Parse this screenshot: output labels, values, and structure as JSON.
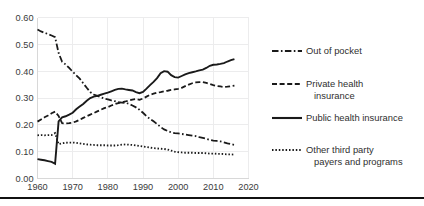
{
  "chart_data": {
    "type": "line",
    "title": "",
    "subtitle": "",
    "xlabel": "",
    "ylabel": "",
    "xlim": [
      1960,
      2020
    ],
    "ylim": [
      0.0,
      0.6
    ],
    "grid": true,
    "legend_position": "right",
    "x_ticks": [
      "1960",
      "1970",
      "1980",
      "1990",
      "2000",
      "2010",
      "2020"
    ],
    "x_tick_values": [
      1960,
      1970,
      1980,
      1990,
      2000,
      2010,
      2020
    ],
    "y_ticks": [
      "0.00",
      "0.10",
      "0.20",
      "0.30",
      "0.40",
      "0.50",
      "0.60"
    ],
    "y_tick_values": [
      0.0,
      0.1,
      0.2,
      0.3,
      0.4,
      0.5,
      0.6
    ],
    "series": [
      {
        "name": "Out of pocket",
        "style": "dashdot",
        "x": [
          1960,
          1961,
          1962,
          1963,
          1964,
          1965,
          1966,
          1967,
          1968,
          1969,
          1970,
          1971,
          1972,
          1973,
          1974,
          1975,
          1976,
          1977,
          1978,
          1979,
          1980,
          1981,
          1982,
          1983,
          1984,
          1985,
          1986,
          1987,
          1988,
          1989,
          1990,
          1991,
          1992,
          1993,
          1994,
          1995,
          1996,
          1997,
          1998,
          1999,
          2000,
          2001,
          2002,
          2003,
          2004,
          2005,
          2006,
          2007,
          2008,
          2009,
          2010,
          2011,
          2012,
          2013,
          2014,
          2015,
          2016
        ],
        "values": [
          0.555,
          0.548,
          0.543,
          0.538,
          0.533,
          0.527,
          0.468,
          0.435,
          0.425,
          0.412,
          0.398,
          0.385,
          0.372,
          0.355,
          0.338,
          0.322,
          0.313,
          0.308,
          0.303,
          0.298,
          0.295,
          0.291,
          0.288,
          0.285,
          0.283,
          0.282,
          0.278,
          0.272,
          0.265,
          0.256,
          0.245,
          0.232,
          0.222,
          0.213,
          0.203,
          0.192,
          0.183,
          0.177,
          0.172,
          0.169,
          0.168,
          0.166,
          0.164,
          0.162,
          0.16,
          0.158,
          0.154,
          0.151,
          0.148,
          0.144,
          0.141,
          0.14,
          0.138,
          0.135,
          0.131,
          0.128,
          0.125
        ]
      },
      {
        "name": "Private health insurance",
        "style": "dashed",
        "x": [
          1960,
          1961,
          1962,
          1963,
          1964,
          1965,
          1966,
          1967,
          1968,
          1969,
          1970,
          1971,
          1972,
          1973,
          1974,
          1975,
          1976,
          1977,
          1978,
          1979,
          1980,
          1981,
          1982,
          1983,
          1984,
          1985,
          1986,
          1987,
          1988,
          1989,
          1990,
          1991,
          1992,
          1993,
          1994,
          1995,
          1996,
          1997,
          1998,
          1999,
          2000,
          2001,
          2002,
          2003,
          2004,
          2005,
          2006,
          2007,
          2008,
          2009,
          2010,
          2011,
          2012,
          2013,
          2014,
          2015,
          2016
        ],
        "values": [
          0.212,
          0.22,
          0.228,
          0.235,
          0.243,
          0.249,
          0.233,
          0.206,
          0.205,
          0.206,
          0.208,
          0.213,
          0.219,
          0.226,
          0.232,
          0.238,
          0.244,
          0.25,
          0.256,
          0.262,
          0.266,
          0.272,
          0.277,
          0.281,
          0.284,
          0.287,
          0.291,
          0.294,
          0.296,
          0.293,
          0.298,
          0.305,
          0.312,
          0.316,
          0.32,
          0.322,
          0.325,
          0.327,
          0.33,
          0.332,
          0.334,
          0.338,
          0.344,
          0.35,
          0.355,
          0.358,
          0.359,
          0.359,
          0.356,
          0.352,
          0.348,
          0.345,
          0.343,
          0.341,
          0.342,
          0.344,
          0.346
        ]
      },
      {
        "name": "Public health insurance",
        "style": "solid",
        "x": [
          1960,
          1961,
          1962,
          1963,
          1964,
          1965,
          1966,
          1967,
          1968,
          1969,
          1970,
          1971,
          1972,
          1973,
          1974,
          1975,
          1976,
          1977,
          1978,
          1979,
          1980,
          1981,
          1982,
          1983,
          1984,
          1985,
          1986,
          1987,
          1988,
          1989,
          1990,
          1991,
          1992,
          1993,
          1994,
          1995,
          1996,
          1997,
          1998,
          1999,
          2000,
          2001,
          2002,
          2003,
          2004,
          2005,
          2006,
          2007,
          2008,
          2009,
          2010,
          2011,
          2012,
          2013,
          2014,
          2015,
          2016
        ],
        "values": [
          0.072,
          0.07,
          0.068,
          0.065,
          0.062,
          0.055,
          0.213,
          0.228,
          0.232,
          0.238,
          0.245,
          0.258,
          0.268,
          0.278,
          0.29,
          0.3,
          0.305,
          0.308,
          0.312,
          0.316,
          0.32,
          0.325,
          0.33,
          0.334,
          0.335,
          0.332,
          0.33,
          0.328,
          0.322,
          0.318,
          0.323,
          0.335,
          0.348,
          0.36,
          0.374,
          0.392,
          0.4,
          0.398,
          0.385,
          0.378,
          0.376,
          0.382,
          0.388,
          0.393,
          0.396,
          0.399,
          0.403,
          0.406,
          0.412,
          0.42,
          0.424,
          0.425,
          0.427,
          0.43,
          0.436,
          0.441,
          0.445
        ]
      },
      {
        "name": "Other third party payers and programs",
        "style": "dotted",
        "x": [
          1960,
          1961,
          1962,
          1963,
          1964,
          1965,
          1966,
          1967,
          1968,
          1969,
          1970,
          1971,
          1972,
          1973,
          1974,
          1975,
          1976,
          1977,
          1978,
          1979,
          1980,
          1981,
          1982,
          1983,
          1984,
          1985,
          1986,
          1987,
          1988,
          1989,
          1990,
          1991,
          1992,
          1993,
          1994,
          1995,
          1996,
          1997,
          1998,
          1999,
          2000,
          2001,
          2002,
          2003,
          2004,
          2005,
          2006,
          2007,
          2008,
          2009,
          2010,
          2011,
          2012,
          2013,
          2014,
          2015,
          2016
        ],
        "values": [
          0.161,
          0.162,
          0.161,
          0.162,
          0.162,
          0.169,
          0.128,
          0.131,
          0.133,
          0.134,
          0.134,
          0.133,
          0.131,
          0.129,
          0.127,
          0.126,
          0.125,
          0.124,
          0.124,
          0.124,
          0.123,
          0.123,
          0.123,
          0.124,
          0.126,
          0.127,
          0.126,
          0.125,
          0.123,
          0.121,
          0.119,
          0.117,
          0.115,
          0.113,
          0.112,
          0.111,
          0.11,
          0.108,
          0.104,
          0.1,
          0.098,
          0.097,
          0.096,
          0.096,
          0.096,
          0.095,
          0.095,
          0.095,
          0.094,
          0.093,
          0.093,
          0.092,
          0.092,
          0.091,
          0.09,
          0.09,
          0.089
        ]
      }
    ]
  },
  "legend": {
    "entries": [
      {
        "label": "Out of pocket",
        "label_line2": "",
        "style": "dashdot"
      },
      {
        "label": "Private health",
        "label_line2": "insurance",
        "style": "dashed"
      },
      {
        "label": "Public health insurance",
        "label_line2": "",
        "style": "solid"
      },
      {
        "label": "Other third party",
        "label_line2": "payers and programs",
        "style": "dotted"
      }
    ]
  },
  "colors": {
    "line": "#1a1a1a",
    "grid": "#ececed",
    "text": "#2f2f2f",
    "background": "#ffffff"
  }
}
